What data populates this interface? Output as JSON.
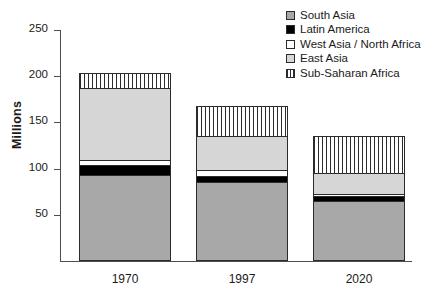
{
  "chart_data": {
    "type": "bar",
    "subtype": "stacked-bar",
    "title": "",
    "xlabel": "",
    "ylabel": "Millions",
    "ylim": [
      0,
      250
    ],
    "yticks": [
      50,
      100,
      150,
      200,
      250
    ],
    "grid": false,
    "legend_position": "top-right",
    "categories": [
      "1970",
      "1997",
      "2020"
    ],
    "stack_order_bottom_to_top": [
      "South Asia",
      "Latin America",
      "West Asia / North Africa",
      "East Asia",
      "Sub-Saharan Africa"
    ],
    "series": [
      {
        "name": "South Asia",
        "color": "#a8a8a8",
        "pattern": "solid",
        "values": [
          93,
          86,
          65
        ]
      },
      {
        "name": "Latin America",
        "color": "#000000",
        "pattern": "solid",
        "values": [
          11,
          6,
          5
        ]
      },
      {
        "name": "West Asia / North Africa",
        "color": "#ffffff",
        "pattern": "solid",
        "values": [
          5,
          6,
          3
        ]
      },
      {
        "name": "East Asia",
        "color": "#d6d6d6",
        "pattern": "solid",
        "values": [
          78,
          37,
          22
        ]
      },
      {
        "name": "Sub-Saharan Africa",
        "color": "#ffffff",
        "pattern": "vertical-stripes",
        "values": [
          17,
          33,
          40
        ]
      }
    ],
    "totals": [
      204,
      168,
      135
    ]
  },
  "axis": {
    "y_title": "Millions",
    "y_ticks": [
      {
        "label": "250",
        "value": 250
      },
      {
        "label": "200",
        "value": 200
      },
      {
        "label": "150",
        "value": 150
      },
      {
        "label": "100",
        "value": 100
      },
      {
        "label": "50",
        "value": 50
      }
    ],
    "x_ticks": [
      {
        "label": "1970"
      },
      {
        "label": "1997"
      },
      {
        "label": "2020"
      }
    ]
  },
  "legend": {
    "items": [
      {
        "label": "South Asia",
        "swatch": "fill-south-asia"
      },
      {
        "label": "Latin America",
        "swatch": "fill-latin-america"
      },
      {
        "label": "West Asia / North Africa",
        "swatch": "fill-west-asia"
      },
      {
        "label": "East Asia",
        "swatch": "fill-east-asia"
      },
      {
        "label": "Sub-Saharan Africa",
        "swatch": "fill-sub-saharan"
      }
    ]
  }
}
